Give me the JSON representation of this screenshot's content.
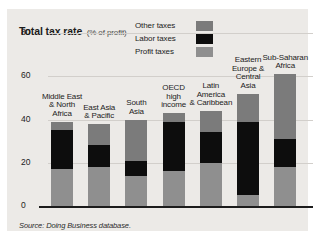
{
  "figure": {
    "title_main": "Total tax rate",
    "title_sub": "(% of profit)",
    "source": "Source: Doing Business database."
  },
  "legend": {
    "items": [
      {
        "label": "Other taxes",
        "color": "#7b7b7b",
        "key": "other"
      },
      {
        "label": "Labor taxes",
        "color": "#0d0d0d",
        "key": "labor"
      },
      {
        "label": "Profit taxes",
        "color": "#8f8f8f",
        "key": "profit"
      }
    ]
  },
  "colors": {
    "panel_background": "#eceae7",
    "gridline": "#d2cfcb",
    "axis": "#1c1c1c",
    "other_taxes": "#7b7b7b",
    "labor_taxes": "#0d0d0d",
    "profit_taxes": "#8f8f8f"
  },
  "chart_data": {
    "type": "bar",
    "title": "Total tax rate (% of profit)",
    "subtitle": "",
    "xlabel": "",
    "ylabel": "% of profit",
    "ylim": [
      0,
      80
    ],
    "yticks": [
      0,
      20,
      40,
      60,
      80
    ],
    "grid": true,
    "stacked": true,
    "legend_position": "top-center",
    "categories": [
      "Middle East & North Africa",
      "East Asia & Pacific",
      "South Asia",
      "OECD high income",
      "Latin America & Caribbean",
      "Eastern Europe & Central Asia",
      "Sub-Saharan Africa"
    ],
    "series": [
      {
        "name": "Profit taxes",
        "color": "#8f8f8f",
        "values": [
          17,
          18,
          14,
          16,
          20,
          5,
          18
        ]
      },
      {
        "name": "Labor taxes",
        "color": "#0d0d0d",
        "values": [
          18,
          10,
          7,
          23,
          14,
          34,
          13
        ]
      },
      {
        "name": "Other taxes",
        "color": "#7b7b7b",
        "values": [
          4,
          10,
          19,
          4,
          10,
          13,
          30
        ]
      }
    ],
    "totals": [
      39,
      38,
      40,
      43,
      44,
      52,
      61
    ]
  },
  "bars": [
    {
      "label": "Middle East\n& North\nAfrica",
      "label_lines": [
        "Middle East",
        "& North",
        "Africa"
      ],
      "total": 39,
      "profit": 17,
      "labor": 18,
      "other": 4
    },
    {
      "label": "East Asia\n& Pacific",
      "label_lines": [
        "East Asia",
        "& Pacific"
      ],
      "total": 38,
      "profit": 18,
      "labor": 10,
      "other": 10
    },
    {
      "label": "South\nAsia",
      "label_lines": [
        "South",
        "Asia"
      ],
      "total": 40,
      "profit": 14,
      "labor": 7,
      "other": 19
    },
    {
      "label": "OECD\nhigh\nincome",
      "label_lines": [
        "OECD",
        "high",
        "income"
      ],
      "total": 43,
      "profit": 16,
      "labor": 23,
      "other": 4
    },
    {
      "label": "Latin\nAmerica\n& Caribbean",
      "label_lines": [
        "Latin",
        "America",
        "& Caribbean"
      ],
      "total": 44,
      "profit": 20,
      "labor": 14,
      "other": 10
    },
    {
      "label": "Eastern\nEurope &\nCentral\nAsia",
      "label_lines": [
        "Eastern",
        "Europe &",
        "Central",
        "Asia"
      ],
      "total": 52,
      "profit": 5,
      "labor": 34,
      "other": 13
    },
    {
      "label": "Sub-Saharan\nAfrica",
      "label_lines": [
        "Sub-Saharan",
        "Africa"
      ],
      "total": 61,
      "profit": 18,
      "labor": 13,
      "other": 30
    }
  ]
}
